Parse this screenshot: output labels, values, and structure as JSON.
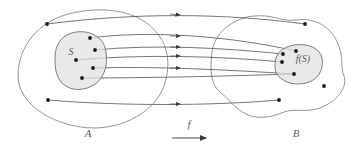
{
  "figure": {
    "type": "set-mapping-diagram",
    "background_color": "#ffffff",
    "outline_color": "#8a8a8a",
    "subset_fill_color": "#e2e2e2",
    "point_color": "#1a1a1a",
    "curve_color": "#4a4a4a",
    "label_color": "#5e5e5e"
  },
  "labels": {
    "domain_set": "A",
    "codomain_set": "B",
    "subset": "S",
    "image_subset": "f(S)",
    "function": "f"
  },
  "chart_data": {
    "type": "diagram",
    "title": "",
    "domain": {
      "name": "A",
      "label_position": {
        "x": 88,
        "y": 134
      },
      "outline_path": "M 18 76 C 18 50, 34 26, 62 16 C 92 6, 128 8, 148 24 C 168 40, 172 62, 164 86 C 154 112, 124 128, 94 128 C 58 128, 18 106, 18 76 Z",
      "subset": {
        "name": "S",
        "label_position": {
          "x": 71,
          "y": 55
        },
        "outline_path": "M 55 58 C 55 44, 62 34, 76 32 C 92 30, 104 38, 106 52 C 108 66, 104 80, 92 86 C 80 92, 68 90, 61 82 C 55 74, 55 66, 55 58 Z",
        "points": [
          {
            "id": "s1",
            "x": 90,
            "y": 38
          },
          {
            "id": "s2",
            "x": 95,
            "y": 50
          },
          {
            "id": "s3",
            "x": 76,
            "y": 60
          },
          {
            "id": "s4",
            "x": 93,
            "y": 68
          },
          {
            "id": "s5",
            "x": 82,
            "y": 78
          }
        ]
      },
      "outside_points": [
        {
          "id": "a1",
          "x": 47,
          "y": 24
        },
        {
          "id": "a2",
          "x": 48,
          "y": 100
        }
      ]
    },
    "codomain": {
      "name": "B",
      "label_position": {
        "x": 296,
        "y": 134
      },
      "outline_path": "M 212 52 C 214 34, 232 18, 254 16 C 272 14, 282 22, 296 20 C 316 17, 332 28, 338 44 C 344 58, 340 66, 344 76 C 348 88, 336 102, 320 108 C 306 113, 294 108, 284 112 C 272 117, 258 120, 246 114 C 234 108, 228 98, 220 92 C 210 84, 210 68, 212 52 Z",
      "subset": {
        "name": "f(S)",
        "label_position": {
          "x": 302,
          "y": 62
        },
        "outline_path": "M 275 64 C 275 54, 282 47, 294 45 C 308 43, 320 48, 322 58 C 324 70, 318 80, 306 83 C 294 86, 282 82, 277 74 C 275 71, 275 67, 275 64 Z",
        "points": [
          {
            "id": "b1",
            "x": 296,
            "y": 51
          },
          {
            "id": "b2",
            "x": 283,
            "y": 54
          },
          {
            "id": "b3",
            "x": 282,
            "y": 62
          },
          {
            "id": "b4",
            "x": 294,
            "y": 74
          }
        ]
      },
      "outside_points": [
        {
          "id": "b5",
          "x": 305,
          "y": 24
        },
        {
          "id": "b6",
          "x": 324,
          "y": 86
        },
        {
          "id": "b7",
          "x": 279,
          "y": 100
        }
      ]
    },
    "mappings": [
      {
        "from": "a1",
        "to": "b5",
        "path": "M 47 24 C 110 16, 200 10, 305 24"
      },
      {
        "from": "s1",
        "to": "b1",
        "path": "M 90 38 C 150 30, 230 36, 296 51"
      },
      {
        "from": "s2",
        "to": "b2",
        "path": "M 95 50 C 155 44, 225 48, 283 54"
      },
      {
        "from": "s3",
        "to": "b3",
        "path": "M 76 60 C 140 54, 220 56, 282 62"
      },
      {
        "from": "s4",
        "to": "b4",
        "path": "M 93 68 C 155 66, 230 70, 294 74"
      },
      {
        "from": "s5",
        "to": "b4",
        "path": "M 82 78 C 150 78, 230 76, 294 74"
      },
      {
        "from": "a2",
        "to": "b7",
        "path": "M 48 100 C 120 106, 210 106, 279 100"
      }
    ],
    "arrowhead_x": 178,
    "arrow_count": 6,
    "function_arrow": {
      "label": "f",
      "label_position": {
        "x": 189,
        "y": 124
      },
      "line": {
        "x1": 172,
        "y1": 136,
        "x2": 209,
        "y2": 136
      }
    }
  }
}
